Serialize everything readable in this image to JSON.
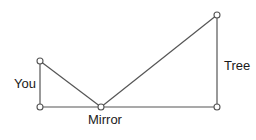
{
  "diagram": {
    "colors": {
      "line": "#555555",
      "node_fill": "#ffffff",
      "node_stroke": "#555555",
      "text": "#1a1a1a"
    },
    "nodes": [
      {
        "id": "you_top",
        "x": 40,
        "y": 61
      },
      {
        "id": "you_base",
        "x": 40,
        "y": 107
      },
      {
        "id": "mirror",
        "x": 101,
        "y": 107
      },
      {
        "id": "tree_base",
        "x": 217,
        "y": 107
      },
      {
        "id": "tree_top",
        "x": 217,
        "y": 15
      }
    ],
    "edges": [
      [
        "you_top",
        "you_base"
      ],
      [
        "you_base",
        "tree_base"
      ],
      [
        "you_top",
        "mirror"
      ],
      [
        "mirror",
        "tree_top"
      ],
      [
        "tree_top",
        "tree_base"
      ]
    ],
    "labels": {
      "you": "You",
      "mirror": "Mirror",
      "tree": "Tree"
    }
  }
}
